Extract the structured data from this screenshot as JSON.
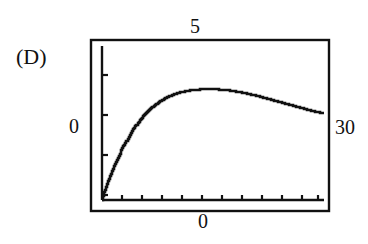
{
  "figure": {
    "panel_label": "(D)",
    "background_color": "#ffffff",
    "ink_color": "#111111"
  },
  "labels": {
    "y_max": "5",
    "y_min": "0",
    "x_max": "30",
    "x_min": "0"
  },
  "chart_data": {
    "type": "line",
    "title": "(D)",
    "subtitle": "",
    "xlabel": "",
    "ylabel": "",
    "xlim": [
      0,
      30
    ],
    "ylim": [
      0,
      5
    ],
    "x_tick_labels": [
      "0",
      "30"
    ],
    "y_tick_labels": [
      "0",
      "5"
    ],
    "x_tick_count": 12,
    "y_tick_count": 4,
    "grid": false,
    "legend": null,
    "style": "graphing-calculator-pixelated",
    "series": [
      {
        "name": "curve",
        "x": [
          0.0,
          0.3,
          0.7,
          1.1,
          1.5,
          2.0,
          2.5,
          3.0,
          3.6,
          4.2,
          4.8,
          5.5,
          6.2,
          7.0,
          7.8,
          8.7,
          9.6,
          10.6,
          11.6,
          12.7,
          13.8,
          15.0,
          16.2,
          17.4,
          18.6,
          19.8,
          21.0,
          22.2,
          23.4,
          24.6,
          25.8,
          27.0,
          28.2,
          29.4,
          30.0
        ],
        "y": [
          0.0,
          0.25,
          0.52,
          0.78,
          1.02,
          1.3,
          1.56,
          1.8,
          2.06,
          2.3,
          2.5,
          2.72,
          2.9,
          3.06,
          3.2,
          3.32,
          3.42,
          3.5,
          3.55,
          3.58,
          3.6,
          3.6,
          3.58,
          3.55,
          3.5,
          3.44,
          3.38,
          3.3,
          3.22,
          3.14,
          3.06,
          2.98,
          2.9,
          2.84,
          2.82
        ]
      }
    ]
  },
  "geometry": {
    "outer_frame": {
      "x": 91,
      "y": 40,
      "width": 238,
      "height": 171
    },
    "inner_axes": {
      "x": 102,
      "y": 46,
      "width": 222,
      "height": 154
    },
    "y_axis_x": 102,
    "x_axis_y": 200,
    "y_tick_y": [
      75,
      115,
      155,
      195
    ],
    "x_tick_x": [
      122,
      142,
      162,
      182,
      202,
      222,
      242,
      262,
      282,
      302,
      318
    ]
  }
}
